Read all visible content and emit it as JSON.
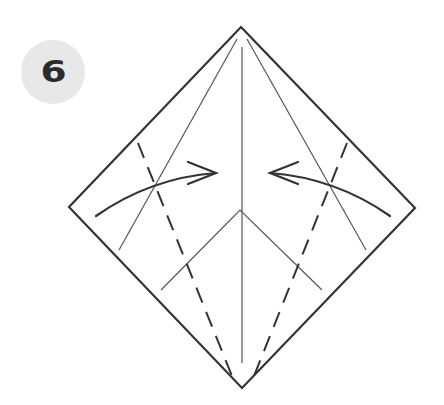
{
  "step": {
    "number": "6"
  },
  "colors": {
    "background": "#ffffff",
    "badge_fill": "#e8e8e8",
    "badge_text": "#2b2b2b",
    "outline": "#333333",
    "crease": "#555555"
  },
  "diagram": {
    "outline": [
      [
        241,
        27
      ],
      [
        415,
        208
      ],
      [
        242,
        388
      ],
      [
        69,
        207
      ]
    ],
    "center_crease": [
      [
        242,
        47
      ],
      [
        242,
        363
      ]
    ],
    "side_creases": [
      [
        [
          237,
          39
        ],
        [
          119,
          250
        ]
      ],
      [
        [
          247,
          39
        ],
        [
          366,
          250
        ]
      ]
    ],
    "inner_v": [
      [
        161,
        290
      ],
      [
        240,
        210
      ],
      [
        322,
        290
      ]
    ],
    "dashed_folds": [
      [
        [
          138,
          143
        ],
        [
          232,
          376
        ]
      ],
      [
        [
          347,
          143
        ],
        [
          254,
          376
        ]
      ]
    ],
    "arrows": [
      {
        "direction": "right",
        "start": [
          96,
          216
        ],
        "control": [
          150,
          178
        ],
        "tip": [
          216,
          173
        ]
      },
      {
        "direction": "left",
        "start": [
          390,
          216
        ],
        "control": [
          336,
          178
        ],
        "tip": [
          270,
          173
        ]
      }
    ]
  }
}
